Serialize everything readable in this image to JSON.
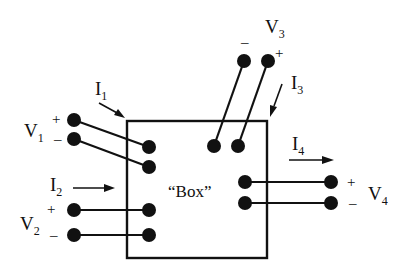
{
  "diagram": {
    "box_label": "“Box”",
    "ports": [
      {
        "id": "port-1",
        "voltage": {
          "main": "V",
          "sub": "1"
        },
        "plus": "+",
        "minus": "–",
        "current": {
          "main": "I",
          "sub": "1"
        },
        "side": "left-upper",
        "current_direction": "into box"
      },
      {
        "id": "port-2",
        "voltage": {
          "main": "V",
          "sub": "2"
        },
        "plus": "+",
        "minus": "–",
        "current": {
          "main": "I",
          "sub": "2"
        },
        "side": "left-lower",
        "current_direction": "into box"
      },
      {
        "id": "port-3",
        "voltage": {
          "main": "V",
          "sub": "3"
        },
        "plus": "+",
        "minus": "–",
        "current": {
          "main": "I",
          "sub": "3"
        },
        "side": "top",
        "current_direction": "into box"
      },
      {
        "id": "port-4",
        "voltage": {
          "main": "V",
          "sub": "4"
        },
        "plus": "+",
        "minus": "–",
        "current": {
          "main": "I",
          "sub": "4"
        },
        "side": "right",
        "current_direction": "out of box"
      }
    ],
    "colors": {
      "ink": "#111111",
      "background": "#ffffff"
    }
  }
}
